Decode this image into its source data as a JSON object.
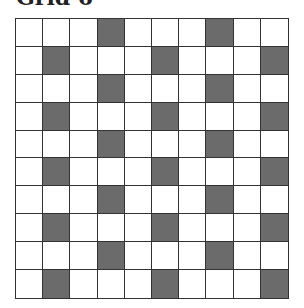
{
  "title": "Grid 6",
  "grid": {
    "rows": 10,
    "cols": 10,
    "shaded_color": "#6b6b6b",
    "empty_color": "#ffffff",
    "line_color": "#333333",
    "shaded_cells": [
      [
        0,
        0,
        0,
        1,
        0,
        0,
        0,
        1,
        0,
        0
      ],
      [
        0,
        1,
        0,
        0,
        0,
        1,
        0,
        0,
        0,
        1
      ],
      [
        0,
        0,
        0,
        1,
        0,
        0,
        0,
        1,
        0,
        0
      ],
      [
        0,
        1,
        0,
        0,
        0,
        1,
        0,
        0,
        0,
        1
      ],
      [
        0,
        0,
        0,
        1,
        0,
        0,
        0,
        1,
        0,
        0
      ],
      [
        0,
        1,
        0,
        0,
        0,
        1,
        0,
        0,
        0,
        1
      ],
      [
        0,
        0,
        0,
        1,
        0,
        0,
        0,
        1,
        0,
        0
      ],
      [
        0,
        1,
        0,
        0,
        0,
        1,
        0,
        0,
        0,
        1
      ],
      [
        0,
        0,
        0,
        1,
        0,
        0,
        0,
        1,
        0,
        0
      ],
      [
        0,
        1,
        0,
        0,
        0,
        1,
        0,
        0,
        0,
        1
      ]
    ]
  }
}
